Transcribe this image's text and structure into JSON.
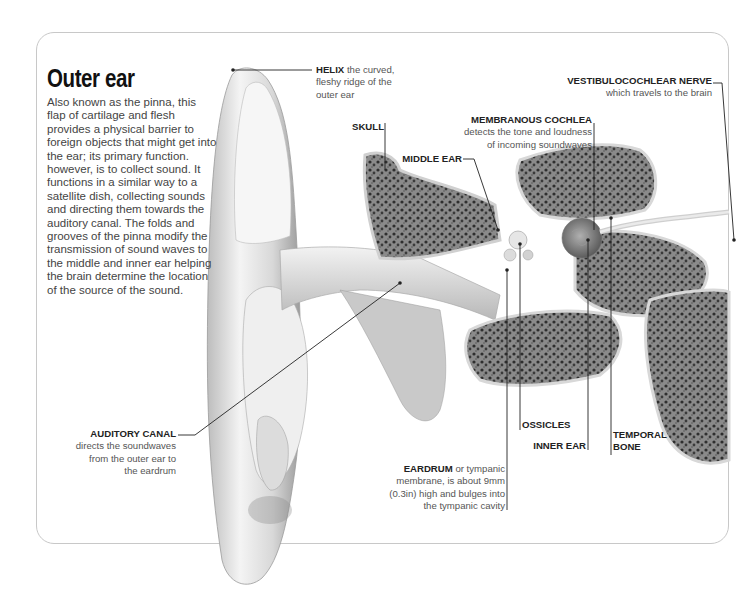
{
  "title": "Outer ear",
  "intro": "Also known as the pinna, this flap of cartilage and flesh provides a physical barrier to foreign objects that might get into the ear; its primary function. however, is to collect sound. It functions in a similar way to a satellite dish, collecting sounds and directing them towards the auditory canal. The folds and grooves of the pinna modify the transmission of sound waves to the middle and inner ear helping the brain determine the location of the source of the sound.",
  "labels": {
    "helix": {
      "name": "HELIX",
      "desc_line1": " the curved,",
      "desc_line2": "fleshy ridge of the",
      "desc_line3": "outer ear"
    },
    "skull": {
      "name": "SKULL"
    },
    "middle_ear": {
      "name": "MIDDLE EAR"
    },
    "membranous_cochlea": {
      "name": "MEMBRANOUS COCHLEA",
      "desc_line1": "detects the tone and loudness",
      "desc_line2": "of incoming soundwaves"
    },
    "vestibulocochlear_nerve": {
      "name": "VESTIBULOCOCHLEAR NERVE",
      "desc_line1": "which travels to the brain"
    },
    "auditory_canal": {
      "name": "AUDITORY CANAL",
      "desc_line1": "directs the soundwaves",
      "desc_line2": "from the outer ear to",
      "desc_line3": "the eardrum"
    },
    "ossicles": {
      "name": "OSSICLES"
    },
    "inner_ear": {
      "name": "INNER EAR"
    },
    "temporal_bone": {
      "name_line1": "TEMPORAL",
      "name_line2": "BONE"
    },
    "eardrum": {
      "name": "EARDRUM",
      "desc_line1": " or tympanic",
      "desc_line2": "membrane, is about 9mm",
      "desc_line3": "(0.3in) high and bulges into",
      "desc_line4": "the tympanic cavity"
    }
  },
  "colors": {
    "panel_border": "#c8c8c8",
    "leader_line": "#222222",
    "bone_dark": "#3a3a3a",
    "tissue_light": "#e8e8e8"
  }
}
